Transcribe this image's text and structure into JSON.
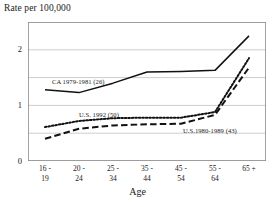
{
  "chart_data": {
    "type": "line",
    "title": "Rate per 100,000",
    "xlabel": "Age",
    "ylabel": "",
    "ylim": [
      0,
      2.5
    ],
    "yticks": [
      0,
      1,
      2
    ],
    "ytick_labels": [
      "0",
      "1",
      "2"
    ],
    "gridlines_y": [
      0,
      0.5,
      1,
      1.5,
      2,
      2.5
    ],
    "grid": true,
    "legend": "inline-annotations",
    "categories": [
      "16 - 19",
      "20 - 24",
      "25 - 34",
      "35 - 44",
      "45 - 54",
      "55 - 64",
      "65 +"
    ],
    "category_lines": [
      {
        "line1": "16 -",
        "line2": "19"
      },
      {
        "line1": "20 -",
        "line2": "24"
      },
      {
        "line1": "25 -",
        "line2": "34"
      },
      {
        "line1": "35 -",
        "line2": "44"
      },
      {
        "line1": "45 -",
        "line2": "54"
      },
      {
        "line1": "55 -",
        "line2": "64"
      },
      {
        "line1": "65 +",
        "line2": ""
      }
    ],
    "series": [
      {
        "name": "CA  1979-1981  (26)",
        "style": "solid",
        "color": "#111111",
        "values": [
          1.28,
          1.23,
          1.4,
          1.6,
          1.61,
          1.63,
          2.25
        ]
      },
      {
        "name": "U.S. 1992  (50)",
        "style": "dotted",
        "color": "#111111",
        "values": [
          0.61,
          0.72,
          0.77,
          0.78,
          0.78,
          0.88,
          1.85
        ]
      },
      {
        "name": "U.S.1980-1989  (43)",
        "style": "dashed",
        "color": "#111111",
        "values": [
          0.4,
          0.58,
          0.64,
          0.66,
          0.67,
          0.83,
          1.68
        ]
      }
    ],
    "annotations": [
      {
        "text": "CA  1979-1981  (26)",
        "series": "CA  1979-1981  (26)"
      },
      {
        "text": "U.S. 1992  (50)",
        "series": "U.S. 1992  (50)"
      },
      {
        "text": "U.S.1980-1989  (43)",
        "series": "U.S.1980-1989  (43)"
      }
    ]
  },
  "colors": {
    "ink": "#111111",
    "grid": "#b9b9b9",
    "axis": "#8a8a8a",
    "background": "#ffffff"
  }
}
